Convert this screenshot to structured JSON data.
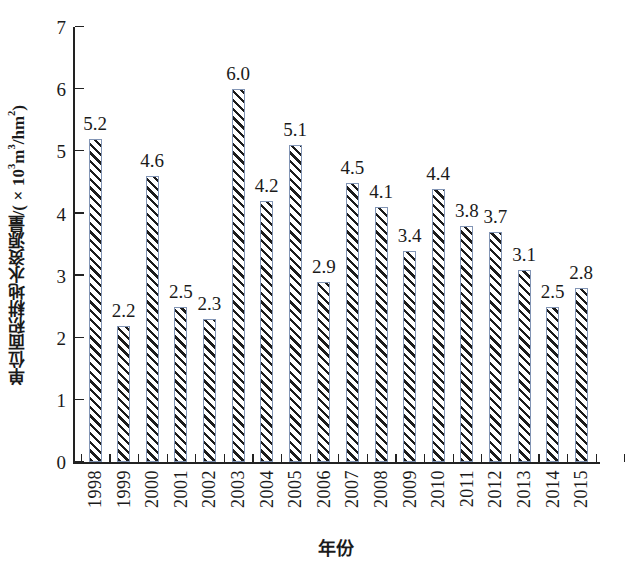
{
  "chart_data": {
    "type": "bar",
    "title": "",
    "subtitle": "",
    "xlabel": "年份",
    "ylabel": "单位面积耕地水资源量/(×10³m³/hm²)",
    "ylabel_parts": {
      "prefix": "单位面积耕地水资源量/(×10",
      "exp1": "3",
      "mid": "m",
      "exp2": "3",
      "unit": "/hm",
      "exp3": "2",
      "suffix": ")"
    },
    "categories": [
      "1998",
      "1999",
      "2000",
      "2001",
      "2002",
      "2003",
      "2004",
      "2005",
      "2006",
      "2007",
      "2008",
      "2009",
      "2010",
      "2011",
      "2012",
      "2013",
      "2014",
      "2015"
    ],
    "values": [
      5.2,
      2.2,
      4.6,
      2.5,
      2.3,
      6.0,
      4.2,
      5.1,
      2.9,
      4.5,
      4.1,
      3.4,
      4.4,
      3.8,
      3.7,
      3.1,
      2.5,
      2.8
    ],
    "value_labels": [
      "5.2",
      "2.2",
      "4.6",
      "2.5",
      "2.3",
      "6.0",
      "4.2",
      "5.1",
      "2.9",
      "4.5",
      "4.1",
      "3.4",
      "4.4",
      "3.8",
      "3.7",
      "3.1",
      "2.5",
      "2.8"
    ],
    "ylim": [
      0,
      7
    ],
    "yticks": [
      0,
      1,
      2,
      3,
      4,
      5,
      6,
      7
    ],
    "ytick_labels": [
      "0",
      "1",
      "2",
      "3",
      "4",
      "5",
      "6",
      "7"
    ],
    "grid": false,
    "legend": null,
    "legend_position": "none",
    "bar_edge_color": "#8295b5",
    "bar_hatch_color": "#1b1b1b",
    "bar_face_color": "#ffffff",
    "axis_color": "#222222",
    "background_color": "#ffffff",
    "tick_direction": "in",
    "spines": [
      "left",
      "bottom"
    ],
    "xtick_label_rotation": 90
  }
}
